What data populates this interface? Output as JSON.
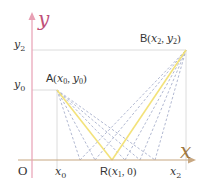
{
  "diagram": {
    "axes": {
      "x_label": "x",
      "y_label": "y",
      "origin_label": "O",
      "x_axis_color": "#c8a882",
      "y_axis_color": "#e8a0b4",
      "axis_label_color_y": "#c0507a",
      "axis_label_color_x": "#a07840"
    },
    "ticks": {
      "x": [
        {
          "label": "x",
          "sub": "0"
        },
        {
          "label": "x",
          "sub": "2"
        }
      ],
      "y": [
        {
          "label": "y",
          "sub": "2"
        },
        {
          "label": "y",
          "sub": "0"
        }
      ]
    },
    "points": {
      "A": {
        "name": "A",
        "coord_text": "(x0, y0)",
        "x": "x",
        "x_sub": "0",
        "y": "y",
        "y_sub": "0"
      },
      "B": {
        "name": "B",
        "coord_text": "(x2, y2)",
        "x": "x",
        "x_sub": "2",
        "y": "y",
        "y_sub": "2"
      },
      "R": {
        "name": "R",
        "coord_text": "(x1, 0)",
        "x": "x",
        "x_sub": "1",
        "y": "0"
      }
    },
    "colors": {
      "reflection_path": "#f3e27a",
      "dashed_paths": "#a8b0cc",
      "grid": "#dddddd",
      "text": "#333333"
    }
  }
}
